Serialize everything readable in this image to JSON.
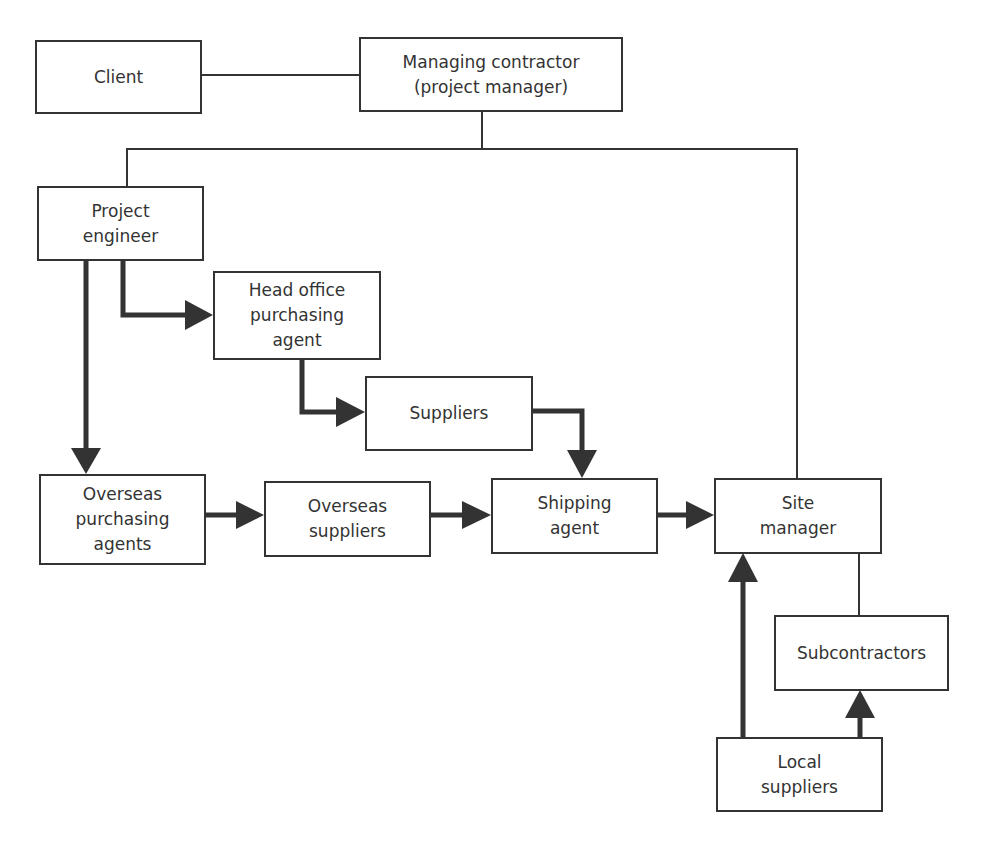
{
  "diagram": {
    "colors": {
      "line": "#333333",
      "box_border": "#333333",
      "background": "#ffffff",
      "text": "#333333"
    },
    "nodes": [
      {
        "id": "client",
        "label": "Client"
      },
      {
        "id": "managing-contractor",
        "label": "Managing contractor\n(project manager)"
      },
      {
        "id": "project-engineer",
        "label": "Project\nengineer"
      },
      {
        "id": "head-office-purchasing-agent",
        "label": "Head office\npurchasing\nagent"
      },
      {
        "id": "suppliers",
        "label": "Suppliers"
      },
      {
        "id": "overseas-purchasing-agents",
        "label": "Overseas\npurchasing\nagents"
      },
      {
        "id": "overseas-suppliers",
        "label": "Overseas\nsuppliers"
      },
      {
        "id": "shipping-agent",
        "label": "Shipping\nagent"
      },
      {
        "id": "site-manager",
        "label": "Site\nmanager"
      },
      {
        "id": "subcontractors",
        "label": "Subcontractors"
      },
      {
        "id": "local-suppliers",
        "label": "Local\nsuppliers"
      }
    ],
    "edges": [
      {
        "from": "client",
        "to": "managing-contractor",
        "type": "line"
      },
      {
        "from": "managing-contractor",
        "to": "project-engineer",
        "type": "line"
      },
      {
        "from": "managing-contractor",
        "to": "site-manager",
        "type": "line"
      },
      {
        "from": "project-engineer",
        "to": "head-office-purchasing-agent",
        "type": "arrow"
      },
      {
        "from": "project-engineer",
        "to": "overseas-purchasing-agents",
        "type": "arrow"
      },
      {
        "from": "head-office-purchasing-agent",
        "to": "suppliers",
        "type": "arrow"
      },
      {
        "from": "suppliers",
        "to": "shipping-agent",
        "type": "arrow"
      },
      {
        "from": "overseas-purchasing-agents",
        "to": "overseas-suppliers",
        "type": "arrow"
      },
      {
        "from": "overseas-suppliers",
        "to": "shipping-agent",
        "type": "arrow"
      },
      {
        "from": "shipping-agent",
        "to": "site-manager",
        "type": "arrow"
      },
      {
        "from": "site-manager",
        "to": "subcontractors",
        "type": "line"
      },
      {
        "from": "local-suppliers",
        "to": "site-manager",
        "type": "arrow"
      },
      {
        "from": "local-suppliers",
        "to": "subcontractors",
        "type": "arrow"
      }
    ]
  }
}
